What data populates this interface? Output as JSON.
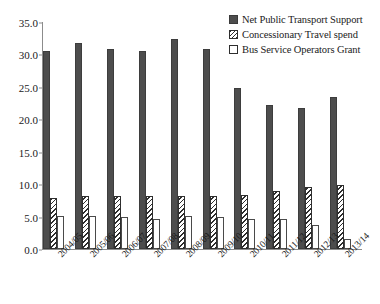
{
  "chart_data": {
    "type": "bar",
    "title": "",
    "xlabel": "",
    "ylabel": "",
    "ylim": [
      0.0,
      35.0
    ],
    "yticks": [
      "0.0",
      "5.0",
      "10.0",
      "15.0",
      "20.0",
      "25.0",
      "30.0",
      "35.0"
    ],
    "ytick_values": [
      0.0,
      5.0,
      10.0,
      15.0,
      20.0,
      25.0,
      30.0,
      35.0
    ],
    "grid": false,
    "legend_position": "top-right",
    "categories": [
      "2004/05",
      "2005/06",
      "2006/07",
      "2007/08",
      "2008/09",
      "2009/10",
      "2010/11",
      "2011/12",
      "2012/13",
      "2013/14"
    ],
    "series": [
      {
        "name": "Net Public Transport Support",
        "swatch": "solid",
        "color": "#4d4d4d",
        "values": [
          30.5,
          31.7,
          30.9,
          30.6,
          32.4,
          30.8,
          24.8,
          22.2,
          21.7,
          23.5
        ]
      },
      {
        "name": "Concessionary Travel spend",
        "swatch": "hatch",
        "color": "#2e2e2e",
        "values": [
          7.8,
          8.1,
          8.1,
          8.2,
          8.1,
          8.1,
          8.4,
          9.0,
          9.6,
          9.8
        ]
      },
      {
        "name": "Bus Service Operators Grant",
        "swatch": "open",
        "color": "#ffffff",
        "values": [
          5.1,
          5.1,
          4.9,
          4.7,
          5.1,
          4.9,
          4.7,
          4.7,
          3.7,
          1.6
        ]
      }
    ]
  }
}
